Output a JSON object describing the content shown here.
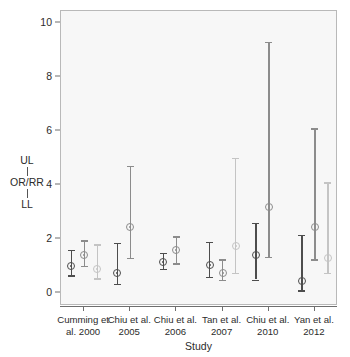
{
  "chart_data": {
    "type": "scatter",
    "title": "",
    "xlabel": "Study",
    "ylabel": "UL OR/RR LL",
    "ylabel_parts": [
      "UL",
      "OR/RR",
      "LL"
    ],
    "categories": [
      "Cumming et al. 2000",
      "Chiu et al. 2005",
      "Chiu et al. 2006",
      "Tan et al. 2007",
      "Chiu et al. 2010",
      "Yan et al. 2012"
    ],
    "category_lines": [
      [
        "Cumming et",
        "al. 2000"
      ],
      [
        "Chiu et al.",
        "2005"
      ],
      [
        "Chiu et al.",
        "2006"
      ],
      [
        "Tan et al.",
        "2007"
      ],
      [
        "Chiu et al.",
        "2010"
      ],
      [
        "Yan et al.",
        "2012"
      ]
    ],
    "ylim": [
      0,
      10.4
    ],
    "yticks": [
      0,
      2,
      4,
      6,
      8,
      10
    ],
    "ytick_labels": [
      "0",
      "2",
      "4",
      "6",
      "8",
      "10"
    ],
    "grid": false,
    "legend": "none",
    "series": [
      {
        "name": "Estimate 1",
        "color": "#4d4d4d",
        "points": [
          {
            "category": "Cumming et al. 2000",
            "value": 1.0,
            "lower": 0.65,
            "upper": 1.6
          },
          {
            "category": "Chiu et al. 2005",
            "value": 0.75,
            "lower": 0.35,
            "upper": 1.85
          },
          {
            "category": "Chiu et al. 2006",
            "value": 1.15,
            "lower": 0.9,
            "upper": 1.5
          },
          {
            "category": "Tan et al. 2007",
            "value": 1.05,
            "lower": 0.6,
            "upper": 1.9
          },
          {
            "category": "Chiu et al. 2010",
            "value": 1.4,
            "lower": 0.5,
            "upper": 2.6
          },
          {
            "category": "Yan et al. 2012",
            "value": 0.45,
            "lower": 0.1,
            "upper": 2.15
          }
        ]
      },
      {
        "name": "Estimate 2",
        "color": "#8c8c8c",
        "points": [
          {
            "category": "Cumming et al. 2000",
            "value": 1.4,
            "lower": 1.0,
            "upper": 1.95
          },
          {
            "category": "Chiu et al. 2005",
            "value": 2.45,
            "lower": 1.3,
            "upper": 4.7
          },
          {
            "category": "Chiu et al. 2006",
            "value": 1.6,
            "lower": 1.1,
            "upper": 2.1
          },
          {
            "category": "Tan et al. 2007",
            "value": 0.75,
            "lower": 0.5,
            "upper": 1.25
          },
          {
            "category": "Chiu et al. 2010",
            "value": 3.2,
            "lower": 1.35,
            "upper": 9.3
          },
          {
            "category": "Yan et al. 2012",
            "value": 2.45,
            "lower": 1.25,
            "upper": 6.1
          }
        ]
      },
      {
        "name": "Estimate 3",
        "color": "#c4c4c4",
        "points": [
          {
            "category": "Cumming et al. 2000",
            "value": 0.9,
            "lower": 0.55,
            "upper": 1.8
          },
          {
            "category": "Tan et al. 2007",
            "value": 1.75,
            "lower": 0.75,
            "upper": 5.0
          },
          {
            "category": "Yan et al. 2012",
            "value": 1.3,
            "lower": 0.75,
            "upper": 4.1
          }
        ]
      }
    ]
  }
}
